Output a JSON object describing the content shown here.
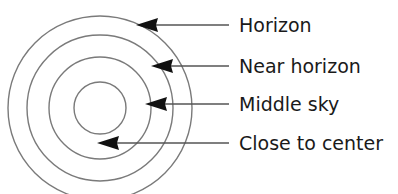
{
  "diagram": {
    "center": {
      "x": 100,
      "y": 108
    },
    "stroke_color": "#7a7a7a",
    "arrow_color": "#111111",
    "line_color": "#555555",
    "rings": [
      {
        "name": "horizon-ring",
        "r": 92
      },
      {
        "name": "near-horizon-ring",
        "r": 73
      },
      {
        "name": "middle-sky-ring",
        "r": 51
      },
      {
        "name": "center-ring",
        "r": 26
      }
    ],
    "labels": [
      {
        "text": "Horizon",
        "y": 25,
        "arrow_tip_x": 136
      },
      {
        "text": "Near horizon",
        "y": 66,
        "arrow_tip_x": 151
      },
      {
        "text": "Middle sky",
        "y": 104,
        "arrow_tip_x": 145
      },
      {
        "text": "Close to center",
        "y": 143,
        "arrow_tip_x": 97
      }
    ],
    "line_end_x": 229
  }
}
